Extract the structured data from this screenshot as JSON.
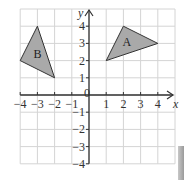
{
  "chart_data": {
    "type": "scatter",
    "title": "",
    "xlabel": "x",
    "ylabel": "y",
    "xlim": [
      -4,
      5
    ],
    "ylim": [
      -4,
      5
    ],
    "grid": true,
    "x_ticks": [
      -4,
      -3,
      -2,
      -1,
      0,
      1,
      2,
      3,
      4
    ],
    "x_tick_labels": [
      "−4",
      "−3",
      "−2",
      "−1",
      "0",
      "1",
      "2",
      "3",
      "4"
    ],
    "y_ticks": [
      -4,
      -3,
      -2,
      -1,
      1,
      2,
      3,
      4
    ],
    "y_tick_labels": [
      "−4",
      "−3",
      "−2",
      "−1",
      "1",
      "2",
      "3",
      "4"
    ],
    "shapes": [
      {
        "name": "A",
        "type": "triangle",
        "vertices": [
          [
            1,
            2
          ],
          [
            2,
            4
          ],
          [
            4,
            3
          ]
        ],
        "label_pos": [
          2.2,
          3.1
        ],
        "fill": "#a9a9a9"
      },
      {
        "name": "B",
        "type": "triangle",
        "vertices": [
          [
            -3,
            4
          ],
          [
            -4,
            2
          ],
          [
            -2,
            1
          ]
        ],
        "label_pos": [
          -3,
          2.4
        ],
        "fill": "#a9a9a9"
      }
    ]
  },
  "colors": {
    "grid": "#d4d4d4",
    "axis": "#333333",
    "shape_fill": "#a9a9a9",
    "shape_stroke": "#333333"
  }
}
